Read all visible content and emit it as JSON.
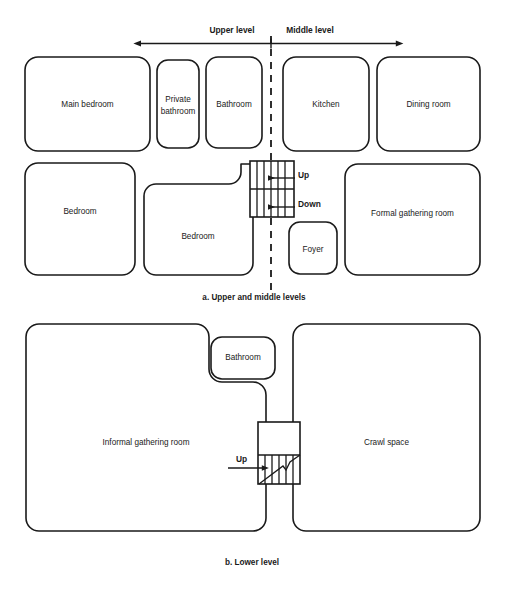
{
  "diagram": {
    "background_color": "#ffffff",
    "line_color": "#1a1a1a"
  },
  "level_scale": {
    "upper_label": "Upper level",
    "middle_label": "Middle level"
  },
  "panel_a": {
    "caption": "a. Upper and middle levels",
    "rooms": [
      {
        "id": "main-bedroom",
        "label": "Main bedroom"
      },
      {
        "id": "private-bathroom",
        "label": "Private bathroom"
      },
      {
        "id": "bathroom-upper",
        "label": "Bathroom"
      },
      {
        "id": "kitchen",
        "label": "Kitchen"
      },
      {
        "id": "dining-room",
        "label": "Dining room"
      },
      {
        "id": "bedroom-left",
        "label": "Bedroom"
      },
      {
        "id": "bedroom-middle",
        "label": "Bedroom"
      },
      {
        "id": "foyer",
        "label": "Foyer"
      },
      {
        "id": "formal-gathering-room",
        "label": "Formal gathering room"
      }
    ],
    "stair_directions": [
      {
        "id": "up",
        "label": "Up"
      },
      {
        "id": "down",
        "label": "Down"
      }
    ]
  },
  "panel_b": {
    "caption": "b. Lower level",
    "rooms": [
      {
        "id": "informal-gathering-room",
        "label": "Informal gathering room"
      },
      {
        "id": "bathroom-lower",
        "label": "Bathroom"
      },
      {
        "id": "crawl-space",
        "label": "Crawl space"
      }
    ],
    "stair_directions": [
      {
        "id": "up",
        "label": "Up"
      }
    ]
  }
}
